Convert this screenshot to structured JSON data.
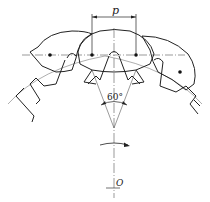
{
  "diagram": {
    "labels": {
      "pitch": "p",
      "angle": "60°",
      "center": "O"
    },
    "colors": {
      "stroke": "#222222",
      "centerline": "#555555",
      "background": "#ffffff"
    }
  }
}
